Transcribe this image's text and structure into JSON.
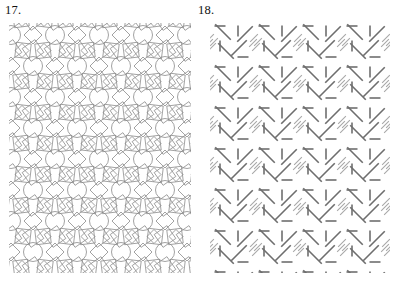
{
  "page": {
    "background_color": "#ffffff",
    "width": 401,
    "height": 284,
    "kind": "geometric-pattern-exercise-figures"
  },
  "figures": [
    {
      "id": "figure-17",
      "label": "17.",
      "pattern_name": "circles-and-rotated-squares-tessellation",
      "description": "Repeating plane pattern of outlined circles surrounded by rotated squares and diamonds, drawn in thin grey line.",
      "stroke_color": "#8a8a8a",
      "stroke_width": 0.8,
      "fill": "none",
      "panel": {
        "x": 9,
        "y": 23,
        "width": 182,
        "height": 250
      },
      "lattice": {
        "type": "half-drop",
        "cell_width": 44,
        "cell_height": 62,
        "columns": 5,
        "rows": 5
      },
      "motifs": {
        "circle_radius": 9.5,
        "square_half_diagonal": 11,
        "diamond_half_diagonal": 9
      }
    },
    {
      "id": "figure-18",
      "label": "18.",
      "pattern_name": "diagonal-stroke-lattice",
      "description": "Repeating plane pattern of short straight dashes at diagonal and vertical angles arranged on a square lattice, drawn in dark grey line.",
      "stroke_color": "#6e6e6e",
      "stroke_width": 1.6,
      "fill": "none",
      "panel": {
        "x": 210,
        "y": 23,
        "width": 180,
        "height": 250
      },
      "lattice": {
        "type": "square",
        "cell_width": 44,
        "cell_height": 41,
        "columns": 4,
        "rows": 6
      },
      "motifs": {
        "long_dash_length": 22,
        "short_dash_length": 11
      }
    }
  ],
  "chart_data": {
    "type": "diagram",
    "title": "",
    "items": [
      {
        "number": "17.",
        "content": "wallpaper pattern of circles and rotated squares"
      },
      {
        "number": "18.",
        "content": "wallpaper pattern of diagonal line segments"
      }
    ]
  }
}
